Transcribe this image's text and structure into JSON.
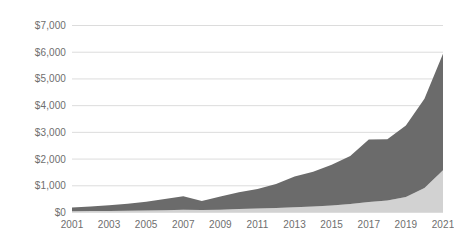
{
  "chart_data": {
    "type": "area",
    "stacked": true,
    "title": "",
    "subtitle": "",
    "xlabel": "",
    "ylabel": "",
    "grid": true,
    "legend_position": "none",
    "xlim": [
      2001,
      2021
    ],
    "ylim": [
      0,
      7000
    ],
    "x": [
      2001,
      2002,
      2003,
      2004,
      2005,
      2006,
      2007,
      2008,
      2009,
      2010,
      2011,
      2012,
      2013,
      2014,
      2015,
      2016,
      2017,
      2018,
      2019,
      2020,
      2021
    ],
    "categories": [
      "2001",
      "2002",
      "2003",
      "2004",
      "2005",
      "2006",
      "2007",
      "2008",
      "2009",
      "2010",
      "2011",
      "2012",
      "2013",
      "2014",
      "2015",
      "2016",
      "2017",
      "2018",
      "2019",
      "2020",
      "2021"
    ],
    "y_tick_values": [
      0,
      1000,
      2000,
      3000,
      4000,
      5000,
      6000,
      7000
    ],
    "y_tick_labels": [
      "$0",
      "$1,000",
      "$2,000",
      "$3,000",
      "$4,000",
      "$5,000",
      "$6,000",
      "$7,000"
    ],
    "x_tick_values": [
      2001,
      2003,
      2005,
      2007,
      2009,
      2011,
      2013,
      2015,
      2017,
      2019,
      2021
    ],
    "x_tick_labels": [
      "2001",
      "2003",
      "2005",
      "2007",
      "2009",
      "2011",
      "2013",
      "2015",
      "2017",
      "2019",
      "2021"
    ],
    "series": [
      {
        "name": "lower-series",
        "color": "#d2d2d2",
        "values": [
          30,
          35,
          40,
          48,
          58,
          70,
          85,
          75,
          85,
          110,
          130,
          150,
          175,
          205,
          245,
          300,
          370,
          430,
          560,
          900,
          1560
        ]
      },
      {
        "name": "upper-series",
        "color": "#6b6b6b",
        "values": [
          140,
          175,
          215,
          265,
          330,
          420,
          505,
          340,
          495,
          630,
          735,
          900,
          1155,
          1300,
          1520,
          1800,
          2340,
          2290,
          2680,
          3340,
          4360
        ]
      }
    ],
    "series_totals": [
      170,
      210,
      255,
      313,
      388,
      490,
      590,
      415,
      580,
      740,
      865,
      1050,
      1330,
      1505,
      1765,
      2100,
      2710,
      2720,
      3240,
      4240,
      5920
    ]
  },
  "colors": {
    "gridline": "#dcdcdc",
    "tick_text": "#6e6e6e",
    "background": "#ffffff",
    "upper_area": "#6b6b6b",
    "lower_area": "#d2d2d2"
  }
}
